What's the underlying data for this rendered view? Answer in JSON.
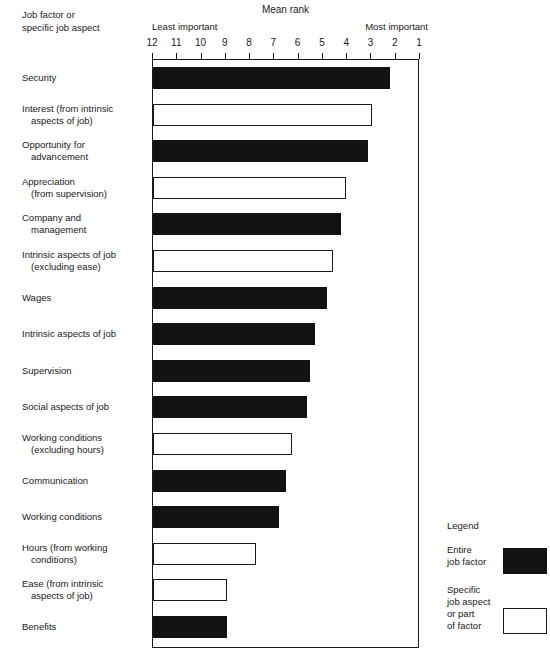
{
  "header": {
    "corner_line1": "Job factor or",
    "corner_line2": "specific job aspect",
    "least_label": "Least important",
    "most_label": "Most important"
  },
  "legend": {
    "title": "Legend",
    "entries": [
      {
        "label_line1": "Entire",
        "label_line2": "job factor",
        "swatch": "filled"
      },
      {
        "label_line1": "Specific",
        "label_line2": "job aspect",
        "label_line3": "or part",
        "label_line4": "of factor",
        "swatch": "hollow"
      }
    ]
  },
  "chart_data": {
    "type": "bar",
    "orientation": "horizontal",
    "title": "Mean rank",
    "xlabel": "Mean rank",
    "ylabel": "Job factor or specific job aspect",
    "xlim": [
      12,
      1
    ],
    "x_axis_reversed": true,
    "xticks": [
      12,
      11,
      10,
      9,
      8,
      7,
      6,
      5,
      4,
      3,
      2,
      1
    ],
    "xtick_labels": [
      "12",
      "11",
      "10",
      "9",
      "8",
      "7",
      "6",
      "5",
      "4",
      "3",
      "2",
      "1"
    ],
    "axis_end_labels": {
      "left": "Least important",
      "right": "Most important"
    },
    "grid": false,
    "legend_position": "bottom-right",
    "series_styles": {
      "filled": "Entire job factor",
      "hollow": "Specific job aspect or part of factor"
    },
    "categories": [
      "Security",
      "Interest (from intrinsic aspects of job)",
      "Opportunity for advancement",
      "Appreciation (from supervision)",
      "Company and management",
      "Intrinsic aspects of job (excluding ease)",
      "Wages",
      "Intrinsic aspects of job",
      "Supervision",
      "Social aspects of job",
      "Working conditions (excluding hours)",
      "Communication",
      "Working conditions",
      "Hours (from working conditions)",
      "Ease (from intrinsic aspects of job)",
      "Benefits"
    ],
    "values": [
      2.2,
      2.95,
      3.1,
      4.0,
      4.2,
      4.55,
      4.8,
      5.3,
      5.5,
      5.6,
      6.25,
      6.5,
      6.75,
      7.7,
      8.9,
      8.9
    ]
  },
  "rows": [
    {
      "line1": "Security",
      "line2": "",
      "value": 2.2,
      "style": "filled"
    },
    {
      "line1": "Interest (from intrinsic",
      "line2": "aspects of job)",
      "value": 2.95,
      "style": "hollow"
    },
    {
      "line1": "Opportunity for",
      "line2": "advancement",
      "value": 3.1,
      "style": "filled"
    },
    {
      "line1": "Appreciation",
      "line2": "(from supervision)",
      "value": 4.0,
      "style": "hollow"
    },
    {
      "line1": "Company and",
      "line2": "management",
      "value": 4.2,
      "style": "filled"
    },
    {
      "line1": "Intrinsic aspects of job",
      "line2": "(excluding ease)",
      "value": 4.55,
      "style": "hollow"
    },
    {
      "line1": "Wages",
      "line2": "",
      "value": 4.8,
      "style": "filled"
    },
    {
      "line1": "Intrinsic aspects of job",
      "line2": "",
      "value": 5.3,
      "style": "filled"
    },
    {
      "line1": "Supervision",
      "line2": "",
      "value": 5.5,
      "style": "filled"
    },
    {
      "line1": "Social aspects of job",
      "line2": "",
      "value": 5.6,
      "style": "filled"
    },
    {
      "line1": "Working conditions",
      "line2": "(excluding hours)",
      "value": 6.25,
      "style": "hollow"
    },
    {
      "line1": "Communication",
      "line2": "",
      "value": 6.5,
      "style": "filled"
    },
    {
      "line1": "Working conditions",
      "line2": "",
      "value": 6.75,
      "style": "filled"
    },
    {
      "line1": "Hours (from working",
      "line2": "conditions)",
      "value": 7.7,
      "style": "hollow"
    },
    {
      "line1": "Ease (from intrinsic",
      "line2": "aspects of job)",
      "value": 8.9,
      "style": "hollow"
    },
    {
      "line1": "Benefits",
      "line2": "",
      "value": 8.9,
      "style": "filled"
    }
  ]
}
